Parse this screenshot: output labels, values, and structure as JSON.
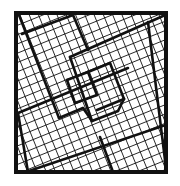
{
  "figure": {
    "colors": {
      "background": "#ffffff",
      "line": "#111111"
    },
    "outer_square": {
      "x": 16,
      "y": 13,
      "width": 150,
      "height": 159
    },
    "grid": {
      "angle_deg": -22,
      "cell_size": 8.6,
      "origin": [
        20,
        15
      ]
    },
    "thick_segments": [
      [
        [
          19,
          15
        ],
        [
          59,
          118
        ]
      ],
      [
        [
          22,
          34
        ],
        [
          73,
          15
        ]
      ],
      [
        [
          73,
          15
        ],
        [
          88,
          50
        ]
      ],
      [
        [
          70,
          57
        ],
        [
          163,
          16
        ]
      ],
      [
        [
          70,
          57
        ],
        [
          92,
          121
        ]
      ],
      [
        [
          148,
          22
        ],
        [
          166,
          168
        ]
      ],
      [
        [
          18,
          113
        ],
        [
          128,
          68
        ]
      ],
      [
        [
          18,
          113
        ],
        [
          28,
          172
        ]
      ],
      [
        [
          26,
          172
        ],
        [
          166,
          125
        ]
      ],
      [
        [
          100,
          137
        ],
        [
          113,
          172
        ]
      ],
      [
        [
          67,
          80
        ],
        [
          88,
          72
        ]
      ],
      [
        [
          88,
          72
        ],
        [
          97,
          95
        ]
      ],
      [
        [
          97,
          95
        ],
        [
          75,
          103
        ]
      ],
      [
        [
          75,
          103
        ],
        [
          67,
          80
        ]
      ],
      [
        [
          88,
          72
        ],
        [
          110,
          63
        ]
      ],
      [
        [
          110,
          63
        ],
        [
          124,
          99
        ]
      ],
      [
        [
          124,
          99
        ],
        [
          97,
          110
        ]
      ],
      [
        [
          59,
          118
        ],
        [
          83,
          108
        ]
      ],
      [
        [
          83,
          108
        ],
        [
          92,
          121
        ]
      ],
      [
        [
          92,
          121
        ],
        [
          118,
          111
        ]
      ],
      [
        [
          118,
          111
        ],
        [
          124,
          99
        ]
      ]
    ]
  }
}
